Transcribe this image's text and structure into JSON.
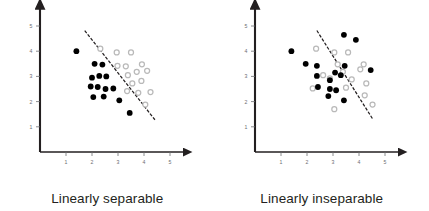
{
  "figure": {
    "background_color": "#ffffff",
    "panel_count": 2
  },
  "panels": [
    {
      "id": "linearly-separable",
      "caption": "Linearly separable"
    },
    {
      "id": "linearly-inseparable",
      "caption": "Linearly inseparable"
    }
  ],
  "chart_data": [
    {
      "type": "scatter",
      "title": "Linearly separable",
      "xlabel": "",
      "ylabel": "",
      "xlim": [
        0,
        5.6
      ],
      "ylim": [
        0,
        5.6
      ],
      "xticks": [
        1,
        2,
        3,
        4,
        5
      ],
      "yticks": [
        1,
        2,
        3,
        4,
        5
      ],
      "grid": false,
      "legend": "none",
      "axis_style": "arrow",
      "colors": {
        "class_a_fill": "#000000",
        "class_b_stroke": "#b9b9b9",
        "axis": "#231f20",
        "tick_label": "#6d6e71",
        "boundary": "#231f20"
      },
      "series": [
        {
          "name": "class-a-filled",
          "marker": "filled-circle",
          "color": "#000000",
          "points": [
            [
              1.4,
              4.0
            ],
            [
              2.1,
              3.5
            ],
            [
              2.4,
              3.47
            ],
            [
              2.0,
              2.95
            ],
            [
              2.28,
              3.02
            ],
            [
              2.55,
              3.0
            ],
            [
              1.95,
              2.6
            ],
            [
              2.22,
              2.58
            ],
            [
              2.52,
              2.5
            ],
            [
              2.82,
              2.52
            ],
            [
              2.05,
              2.18
            ],
            [
              2.45,
              2.2
            ],
            [
              3.05,
              2.05
            ],
            [
              3.45,
              1.55
            ]
          ]
        },
        {
          "name": "class-b-open",
          "marker": "open-circle",
          "color": "#b9b9b9",
          "points": [
            [
              2.32,
              4.1
            ],
            [
              2.95,
              3.95
            ],
            [
              3.5,
              3.95
            ],
            [
              2.98,
              3.42
            ],
            [
              3.3,
              3.4
            ],
            [
              3.92,
              3.48
            ],
            [
              3.38,
              3.05
            ],
            [
              3.72,
              3.18
            ],
            [
              4.12,
              3.22
            ],
            [
              3.55,
              2.72
            ],
            [
              3.9,
              2.82
            ],
            [
              3.35,
              2.42
            ],
            [
              3.78,
              2.35
            ],
            [
              4.25,
              2.38
            ],
            [
              4.05,
              1.88
            ]
          ]
        }
      ],
      "annotations": [
        {
          "type": "decision-boundary",
          "style": "dashed",
          "x1": 1.72,
          "y1": 4.82,
          "x2": 4.42,
          "y2": 1.28
        }
      ]
    },
    {
      "type": "scatter",
      "title": "Linearly inseparable",
      "xlabel": "",
      "ylabel": "",
      "xlim": [
        0,
        5.6
      ],
      "ylim": [
        0,
        5.6
      ],
      "xticks": [
        1,
        2,
        3,
        4,
        5
      ],
      "yticks": [
        1,
        2,
        3,
        4,
        5
      ],
      "grid": false,
      "legend": "none",
      "axis_style": "arrow",
      "colors": {
        "class_a_fill": "#000000",
        "class_b_stroke": "#b9b9b9",
        "axis": "#231f20",
        "tick_label": "#6d6e71",
        "boundary": "#231f20"
      },
      "series": [
        {
          "name": "class-a-filled",
          "marker": "filled-circle",
          "color": "#000000",
          "points": [
            [
              1.4,
              4.0
            ],
            [
              3.42,
              4.65
            ],
            [
              3.88,
              4.45
            ],
            [
              1.95,
              3.5
            ],
            [
              2.38,
              3.42
            ],
            [
              3.45,
              3.42
            ],
            [
              4.45,
              3.25
            ],
            [
              2.38,
              3.02
            ],
            [
              3.08,
              3.15
            ],
            [
              3.3,
              3.05
            ],
            [
              2.88,
              2.85
            ],
            [
              2.42,
              2.58
            ],
            [
              2.88,
              2.5
            ],
            [
              3.12,
              2.45
            ],
            [
              2.82,
              2.22
            ],
            [
              3.42,
              2.05
            ]
          ]
        },
        {
          "name": "class-b-open",
          "marker": "open-circle",
          "color": "#b9b9b9",
          "points": [
            [
              2.35,
              4.1
            ],
            [
              3.05,
              3.95
            ],
            [
              3.58,
              3.95
            ],
            [
              3.18,
              3.48
            ],
            [
              4.18,
              3.48
            ],
            [
              3.38,
              3.18
            ],
            [
              4.05,
              3.28
            ],
            [
              2.62,
              3.05
            ],
            [
              2.88,
              2.92
            ],
            [
              3.72,
              2.88
            ],
            [
              4.28,
              2.72
            ],
            [
              3.5,
              2.55
            ],
            [
              2.22,
              2.52
            ],
            [
              4.22,
              2.25
            ],
            [
              3.05,
              1.7
            ],
            [
              4.52,
              1.88
            ]
          ]
        }
      ],
      "annotations": [
        {
          "type": "decision-boundary",
          "style": "dashed",
          "x1": 2.38,
          "y1": 4.82,
          "x2": 4.52,
          "y2": 1.32
        }
      ]
    }
  ]
}
